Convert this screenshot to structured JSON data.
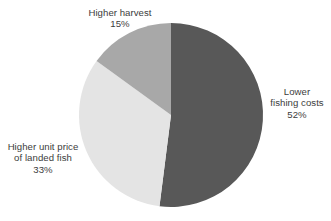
{
  "chart_data": {
    "type": "pie",
    "title": "",
    "subtitle": "",
    "xlabel": "",
    "ylabel": "",
    "legend_position": "none",
    "grid": false,
    "labels_outside": true,
    "start_angle_deg": 0,
    "direction": "clockwise",
    "categories": [
      "Lower fishing costs",
      "Higher unit price of landed fish",
      "Higher harvest"
    ],
    "values": [
      52,
      33,
      15
    ],
    "value_suffix": "%",
    "colors": [
      "#585858",
      "#e4e4e4",
      "#a8a8a8"
    ],
    "slices": [
      {
        "name": "Lower fishing costs",
        "value": 52,
        "value_text": "52%",
        "color": "#585858",
        "label_lines": [
          "Lower",
          "fishing costs"
        ],
        "start_deg": 0,
        "end_deg": 187.2
      },
      {
        "name": "Higher unit price of landed fish",
        "value": 33,
        "value_text": "33%",
        "color": "#e4e4e4",
        "label_lines": [
          "Higher unit price",
          "of landed fish"
        ],
        "start_deg": 187.2,
        "end_deg": 306.0
      },
      {
        "name": "Higher harvest",
        "value": 15,
        "value_text": "15%",
        "color": "#a8a8a8",
        "label_lines": [
          "Higher harvest"
        ],
        "start_deg": 306.0,
        "end_deg": 360.0
      }
    ]
  },
  "labels": {
    "higher_harvest": {
      "line1": "Higher harvest",
      "value": "15%"
    },
    "lower_fishing_costs": {
      "line1": "Lower",
      "line2": "fishing costs",
      "value": "52%"
    },
    "higher_unit_price": {
      "line1": "Higher unit price",
      "line2": "of landed fish",
      "value": "33%"
    }
  },
  "style": {
    "background": "#ffffff",
    "text_color": "#3c3c3c",
    "slice_dark": "#585858",
    "slice_medium": "#a8a8a8",
    "slice_light": "#e4e4e4"
  }
}
